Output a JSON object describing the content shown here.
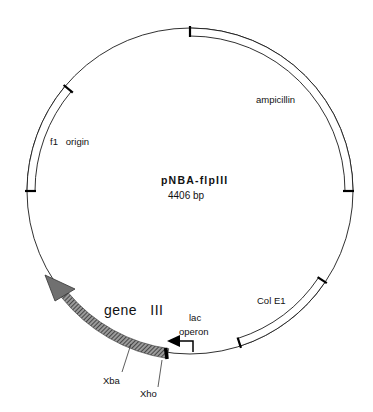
{
  "plasmid": {
    "name": "pNBA-flpIII",
    "size_label": "4406 bp"
  },
  "features": [
    {
      "id": "ampicillin",
      "label": "ampicillin",
      "type": "band"
    },
    {
      "id": "f1_origin",
      "label": "f1   origin",
      "type": "band"
    },
    {
      "id": "col_e1",
      "label": "Col E1",
      "type": "band"
    },
    {
      "id": "gene_iii",
      "label": "gene   III",
      "type": "arrow"
    },
    {
      "id": "lac_operon",
      "label_line1": "lac",
      "label_line2": "operon",
      "type": "promoter"
    }
  ],
  "sites": [
    {
      "id": "xba",
      "label": "Xba"
    },
    {
      "id": "xho",
      "label": "Xho"
    }
  ],
  "colors": {
    "line": "#1a1a1a",
    "gene_fill": "#6a6a6a",
    "arrowhead": "#707070"
  }
}
